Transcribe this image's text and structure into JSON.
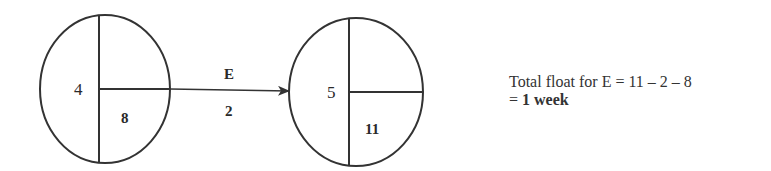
{
  "diagram": {
    "type": "activity-on-node network fragment",
    "nodes": [
      {
        "id": "node-4",
        "event_number": "4",
        "earliest_time": "8",
        "latest_time": ""
      },
      {
        "id": "node-5",
        "event_number": "5",
        "earliest_time": "",
        "latest_time": "11"
      }
    ],
    "edge": {
      "from": "node-4",
      "to": "node-5",
      "activity": "E",
      "duration": "2"
    },
    "colors": {
      "stroke": "#333333",
      "text": "#2a2a2a",
      "background": "#ffffff"
    }
  },
  "note": {
    "line1": "Total float for E = 11 – 2 – 8",
    "line2_prefix": "= ",
    "line2_value": "1 week"
  }
}
